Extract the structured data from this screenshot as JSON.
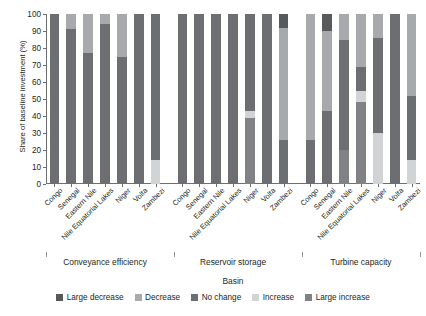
{
  "chart_data": {
    "type": "bar",
    "stacked": true,
    "title": "",
    "xlabel": "Basin",
    "ylabel": "Share of baseline investment (%)",
    "ylim": [
      0,
      100
    ],
    "yticks": [
      0,
      10,
      20,
      30,
      40,
      50,
      60,
      70,
      80,
      90,
      100
    ],
    "grid": false,
    "legend_position": "bottom",
    "legend": [
      {
        "name": "Large decrease",
        "color": "#58595b"
      },
      {
        "name": "Decrease",
        "color": "#a7a9ac"
      },
      {
        "name": "No change",
        "color": "#6d6e71"
      },
      {
        "name": "Increase",
        "color": "#d1d3d4"
      },
      {
        "name": "Large increase",
        "color": "#808285"
      }
    ],
    "series": [
      {
        "name": "Large decrease",
        "color": "#58595b"
      },
      {
        "name": "Decrease",
        "color": "#a7a9ac"
      },
      {
        "name": "No change",
        "color": "#6d6e71"
      },
      {
        "name": "Increase",
        "color": "#d1d3d4"
      },
      {
        "name": "Large increase",
        "color": "#808285"
      }
    ],
    "groups": [
      {
        "label": "Conveyance efficiency",
        "categories": [
          "Congo",
          "Senegal",
          "Eastern Nile",
          "Nile Equatorial Lakes",
          "Niger",
          "Volta",
          "Zambezi"
        ],
        "values": [
          {
            "Large decrease": 0,
            "Decrease": 0,
            "No change": 100,
            "Increase": 0,
            "Large increase": 0
          },
          {
            "Large decrease": 0,
            "Decrease": 9,
            "No change": 91,
            "Increase": 0,
            "Large increase": 0
          },
          {
            "Large decrease": 0,
            "Decrease": 23,
            "No change": 77,
            "Increase": 0,
            "Large increase": 0
          },
          {
            "Large decrease": 0,
            "Decrease": 6,
            "No change": 94,
            "Increase": 0,
            "Large increase": 0
          },
          {
            "Large decrease": 0,
            "Decrease": 25,
            "No change": 75,
            "Increase": 0,
            "Large increase": 0
          },
          {
            "Large decrease": 0,
            "Decrease": 0,
            "No change": 100,
            "Increase": 0,
            "Large increase": 0
          },
          {
            "Large decrease": 0,
            "Decrease": 0,
            "No change": 86,
            "Increase": 14,
            "Large increase": 0
          }
        ]
      },
      {
        "label": "Reservoir storage",
        "categories": [
          "Congo",
          "Senegal",
          "Eastern Nile",
          "Nile Equatorial Lakes",
          "Niger",
          "Volta",
          "Zambezi"
        ],
        "values": [
          {
            "Large decrease": 0,
            "Decrease": 0,
            "No change": 100,
            "Increase": 0,
            "Large increase": 0
          },
          {
            "Large decrease": 0,
            "Decrease": 0,
            "No change": 100,
            "Increase": 0,
            "Large increase": 0
          },
          {
            "Large decrease": 0,
            "Decrease": 0,
            "No change": 100,
            "Increase": 0,
            "Large increase": 0
          },
          {
            "Large decrease": 0,
            "Decrease": 0,
            "No change": 100,
            "Increase": 0,
            "Large increase": 0
          },
          {
            "Large decrease": 0,
            "Decrease": 0,
            "No change": 57,
            "Increase": 4,
            "Large increase": 39
          },
          {
            "Large decrease": 0,
            "Decrease": 0,
            "No change": 100,
            "Increase": 0,
            "Large increase": 0
          },
          {
            "Large decrease": 8,
            "Decrease": 66,
            "No change": 26,
            "Increase": 0,
            "Large increase": 0
          }
        ]
      },
      {
        "label": "Turbine capacity",
        "categories": [
          "Congo",
          "Senegal",
          "Eastern Nile",
          "Nile Equatorial Lakes",
          "Niger",
          "Volta",
          "Zambezi"
        ],
        "values": [
          {
            "Large decrease": 0,
            "Decrease": 74,
            "No change": 26,
            "Increase": 0,
            "Large increase": 0
          },
          {
            "Large decrease": 10,
            "Decrease": 47,
            "No change": 43,
            "Increase": 0,
            "Large increase": 0
          },
          {
            "Large decrease": 0,
            "Decrease": 15,
            "No change": 65,
            "Increase": 0,
            "Large increase": 20
          },
          {
            "Large decrease": 0,
            "Decrease": 31,
            "No change": 14,
            "Increase": 7,
            "Large increase": 48
          },
          {
            "Large decrease": 0,
            "Decrease": 14,
            "No change": 56,
            "Increase": 30,
            "Large increase": 0
          },
          {
            "Large decrease": 0,
            "Decrease": 0,
            "No change": 100,
            "Increase": 0,
            "Large increase": 0
          },
          {
            "Large decrease": 0,
            "Decrease": 48,
            "No change": 38,
            "Increase": 14,
            "Large increase": 0
          }
        ]
      }
    ]
  }
}
